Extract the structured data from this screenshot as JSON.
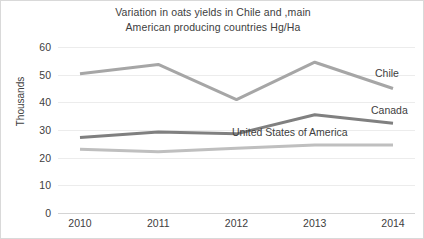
{
  "chart_data": {
    "type": "line",
    "title": "Variation in oats yields in Chile and ,main American producing countries Hg/Ha",
    "title_lines": [
      "Variation in oats yields in Chile and ,main",
      "American producing countries Hg/Ha"
    ],
    "xlabel": "",
    "ylabel": "Thousands",
    "categories": [
      "2010",
      "2011",
      "2012",
      "2013",
      "2014"
    ],
    "x": [
      2010,
      2011,
      2012,
      2013,
      2014
    ],
    "ylim": [
      0,
      60
    ],
    "y_ticks": [
      0,
      10,
      20,
      30,
      40,
      50,
      60
    ],
    "y_tick_labels": [
      "0",
      "10",
      "20",
      "30",
      "40",
      "50",
      "60"
    ],
    "grid": true,
    "grid_axis": "y",
    "legend": "inline-labels-right",
    "series": [
      {
        "name": "Chile",
        "values": [
          50.3,
          53.7,
          41.0,
          54.5,
          45.0
        ],
        "color": "#a6a6a6"
      },
      {
        "name": "Canada",
        "values": [
          27.3,
          29.3,
          28.6,
          35.5,
          32.4
        ],
        "color": "#808080"
      },
      {
        "name": "United States of America",
        "values": [
          23.0,
          22.1,
          23.4,
          24.6,
          24.6
        ],
        "color": "#bfbfbf"
      }
    ],
    "annotations": [
      {
        "text": "Chile",
        "series": "Chile"
      },
      {
        "text": "Canada",
        "series": "Canada"
      },
      {
        "text": "United States of America",
        "series": "United States of America"
      }
    ]
  },
  "colors": {
    "background": "#ffffff",
    "text": "#404040",
    "gridline": "#ececec",
    "axis": "#d4d4d4",
    "chile": "#a6a6a6",
    "canada": "#808080",
    "usa": "#bfbfbf"
  }
}
